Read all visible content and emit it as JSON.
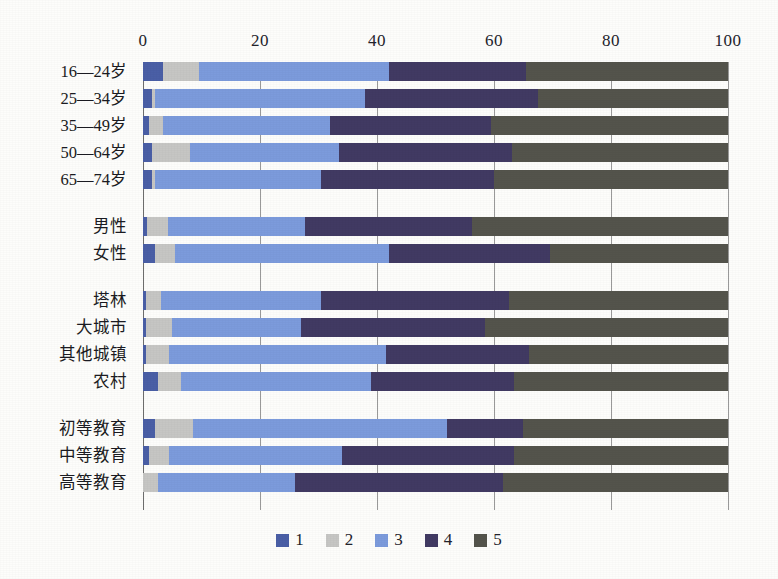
{
  "chart_data": {
    "type": "bar",
    "orientation": "horizontal",
    "stacked": true,
    "stack_total": 100,
    "title": "",
    "xlabel": "",
    "ylabel": "",
    "xlim": [
      0,
      100
    ],
    "xticks": [
      0,
      20,
      40,
      60,
      80,
      100
    ],
    "xtick_labels": [
      "0",
      "20",
      "40",
      "60",
      "80",
      "100"
    ],
    "grid": true,
    "legend_position": "bottom",
    "series": [
      {
        "name": "1",
        "color": "#4a5fa6",
        "values": [
          3.5,
          1.5,
          1.0,
          1.5,
          1.5,
          0.7,
          2.0,
          0.5,
          0.5,
          0.5,
          2.5,
          2.0,
          1.0,
          0.0
        ]
      },
      {
        "name": "2",
        "color": "#c6c6c4",
        "values": [
          6.0,
          0.5,
          2.5,
          6.5,
          0.5,
          3.5,
          3.5,
          2.5,
          4.5,
          4.0,
          4.0,
          6.5,
          3.5,
          2.5
        ]
      },
      {
        "name": "3",
        "color": "#7c9bdc",
        "values": [
          32.5,
          36.0,
          28.5,
          25.5,
          28.5,
          23.5,
          36.5,
          27.5,
          22.0,
          37.0,
          32.5,
          43.5,
          29.5,
          23.5
        ]
      },
      {
        "name": "4",
        "color": "#413a63",
        "values": [
          23.5,
          29.5,
          27.5,
          29.5,
          29.5,
          28.5,
          27.5,
          32.0,
          31.5,
          24.5,
          24.5,
          13.0,
          29.5,
          35.5
        ]
      },
      {
        "name": "5",
        "color": "#54544c",
        "values": [
          34.5,
          32.5,
          40.5,
          37.0,
          40.0,
          43.8,
          30.5,
          37.5,
          41.5,
          34.0,
          36.5,
          35.0,
          36.5,
          38.5
        ]
      }
    ],
    "categories": [
      "16—24岁",
      "25—34岁",
      "35—49岁",
      "50—64岁",
      "65—74岁",
      "男性",
      "女性",
      "塔林",
      "大城市",
      "其他城镇",
      "农村",
      "初等教育",
      "中等教育",
      "高等教育"
    ],
    "category_groups": [
      {
        "name": "年龄",
        "categories": [
          "16—24岁",
          "25—34岁",
          "35—49岁",
          "50—64岁",
          "65—74岁"
        ]
      },
      {
        "name": "性别",
        "categories": [
          "男性",
          "女性"
        ]
      },
      {
        "name": "居住地",
        "categories": [
          "塔林",
          "大城市",
          "其他城镇",
          "农村"
        ]
      },
      {
        "name": "教育程度",
        "categories": [
          "初等教育",
          "中等教育",
          "高等教育"
        ]
      }
    ],
    "legend": [
      {
        "label": "1",
        "color": "#4a5fa6"
      },
      {
        "label": "2",
        "color": "#c6c6c4"
      },
      {
        "label": "3",
        "color": "#7c9bdc"
      },
      {
        "label": "4",
        "color": "#413a63"
      },
      {
        "label": "5",
        "color": "#54544c"
      }
    ]
  },
  "axis": {
    "ticks": [
      "0",
      "20",
      "40",
      "60",
      "80",
      "100"
    ]
  },
  "rows": [
    {
      "label": "16—24岁",
      "values": [
        3.5,
        6.0,
        32.5,
        23.5,
        34.5
      ]
    },
    {
      "label": "25—34岁",
      "values": [
        1.5,
        0.5,
        36.0,
        29.5,
        32.5
      ]
    },
    {
      "label": "35—49岁",
      "values": [
        1.0,
        2.5,
        28.5,
        27.5,
        40.5
      ]
    },
    {
      "label": "50—64岁",
      "values": [
        1.5,
        6.5,
        25.5,
        29.5,
        37.0
      ]
    },
    {
      "label": "65—74岁",
      "values": [
        1.5,
        0.5,
        28.5,
        29.5,
        40.0
      ]
    },
    {
      "label": "男性",
      "values": [
        0.7,
        3.5,
        23.5,
        28.5,
        43.8
      ]
    },
    {
      "label": "女性",
      "values": [
        2.0,
        3.5,
        36.5,
        27.5,
        30.5
      ]
    },
    {
      "label": "塔林",
      "values": [
        0.5,
        2.5,
        27.5,
        32.0,
        37.5
      ]
    },
    {
      "label": "大城市",
      "values": [
        0.5,
        4.5,
        22.0,
        31.5,
        41.5
      ]
    },
    {
      "label": "其他城镇",
      "values": [
        0.5,
        4.0,
        37.0,
        24.5,
        34.0
      ]
    },
    {
      "label": "农村",
      "values": [
        2.5,
        4.0,
        32.5,
        24.5,
        36.5
      ]
    },
    {
      "label": "初等教育",
      "values": [
        2.0,
        6.5,
        43.5,
        13.0,
        35.0
      ]
    },
    {
      "label": "中等教育",
      "values": [
        1.0,
        3.5,
        29.5,
        29.5,
        36.5
      ]
    },
    {
      "label": "高等教育",
      "values": [
        0.0,
        2.5,
        23.5,
        35.5,
        38.5
      ]
    }
  ],
  "legend": {
    "items": [
      {
        "label": "1",
        "color": "#4a5fa6"
      },
      {
        "label": "2",
        "color": "#c6c6c4"
      },
      {
        "label": "3",
        "color": "#7c9bdc"
      },
      {
        "label": "4",
        "color": "#413a63"
      },
      {
        "label": "5",
        "color": "#54544c"
      }
    ]
  }
}
